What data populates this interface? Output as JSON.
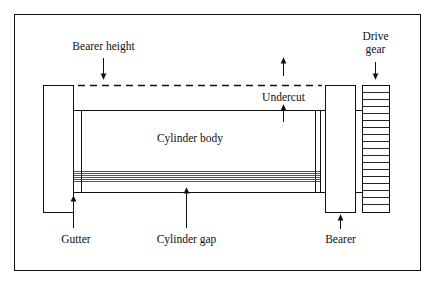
{
  "figure": {
    "kind": "technical-line-diagram",
    "frame": {
      "stroke_color": "#111111"
    },
    "background_color": "#ffffff",
    "ink_color": "#111111"
  },
  "labels": {
    "bearer_height": "Bearer height",
    "undercut": "Undercut",
    "drive_gear_line1": "Drive",
    "drive_gear_line2": "gear",
    "cylinder_body": "Cylinder body",
    "gutter": "Gutter",
    "cylinder_gap": "Cylinder gap",
    "bearer": "Bearer"
  },
  "parts": {
    "left_bearer": {
      "name": "Bearer",
      "shape": "rectangle"
    },
    "right_bearer": {
      "name": "Bearer",
      "shape": "rectangle"
    },
    "cylinder_body": {
      "name": "Cylinder body",
      "shape": "rectangle"
    },
    "drive_gear": {
      "name": "Drive gear",
      "shape": "toothed-rectangle",
      "tooth_count": 17
    },
    "gutter": {
      "name": "Gutter",
      "shape": "vertical-line"
    },
    "cylinder_gap": {
      "name": "Cylinder gap",
      "shape": "line-band",
      "line_count": 6
    },
    "bearer_height_datum": {
      "name": "Bearer height",
      "shape": "dashed-datum-line"
    },
    "undercut": {
      "name": "Undercut",
      "shape": "gap-between-datum-and-body"
    }
  },
  "annotations": [
    {
      "label": "Bearer height",
      "points_to": "dashed datum line",
      "arrow": "down"
    },
    {
      "label": "Undercut",
      "points_to": "dashed datum line and cylinder body top",
      "arrow": "up-and-down"
    },
    {
      "label": "Drive gear",
      "points_to": "toothed gear top",
      "arrow": "down"
    },
    {
      "label": "Gutter",
      "points_to": "gutter line bottom",
      "arrow": "up"
    },
    {
      "label": "Cylinder gap",
      "points_to": "cylinder gap band",
      "arrow": "up"
    },
    {
      "label": "Bearer",
      "points_to": "right bearer bottom",
      "arrow": "up"
    }
  ]
}
